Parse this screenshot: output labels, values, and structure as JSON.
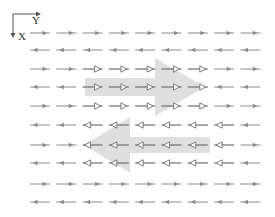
{
  "axes": {
    "x_label": "X",
    "y_label": "Y"
  },
  "colors": {
    "small_arrow": "#8a8a8a",
    "hollow_arrow": "#707070",
    "big_arrow": "#d9d9d9",
    "axis": "#555555"
  },
  "grid": {
    "columns": 9,
    "col_start_x": 30,
    "col_spacing": 26.3,
    "arrow_length": 20,
    "row_y": [
      33,
      50,
      69,
      87,
      106,
      125,
      145,
      163,
      184,
      202
    ]
  },
  "rows": [
    [
      "R",
      "R",
      "R",
      "R",
      "R",
      "R",
      "R",
      "R",
      "R"
    ],
    [
      "L",
      "L",
      "L",
      "L",
      "L",
      "L",
      "L",
      "L",
      "L"
    ],
    [
      "R",
      "R",
      "HR",
      "HR",
      "HR",
      "HR",
      "HR",
      "R",
      "R"
    ],
    [
      "L",
      "L",
      "HR",
      "HR",
      "HR",
      "HR",
      "HR",
      "L",
      "L"
    ],
    [
      "R",
      "R",
      "HR",
      "HR",
      "HR",
      "HR",
      "HR",
      "R",
      "R"
    ],
    [
      "L",
      "L",
      "HL",
      "HL",
      "HL",
      "HL",
      "HL",
      "HL",
      "L"
    ],
    [
      "R",
      "R",
      "HL",
      "HL",
      "HL",
      "HL",
      "HL",
      "HL",
      "R"
    ],
    [
      "L",
      "L",
      "HL",
      "HL",
      "HL",
      "HL",
      "HL",
      "HL",
      "L"
    ],
    [
      "R",
      "R",
      "R",
      "R",
      "R",
      "R",
      "R",
      "R",
      "R"
    ],
    [
      "L",
      "L",
      "L",
      "L",
      "L",
      "L",
      "L",
      "L",
      "L"
    ]
  ],
  "legend": {
    "R": "small arrow pointing right (filled head)",
    "L": "small arrow pointing left (filled head)",
    "HR": "arrow pointing right (hollow head)",
    "HL": "arrow pointing left (hollow head)"
  },
  "big_arrows": [
    {
      "direction": "right",
      "points": "85,78 155,78 155,58 205,87 155,116 155,96 85,96"
    },
    {
      "direction": "left",
      "points": "210,137 130,137 130,117 84,145 130,173 130,153 210,153"
    }
  ]
}
